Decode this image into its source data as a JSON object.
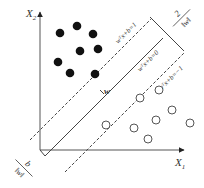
{
  "diagram": {
    "type": "svm-maximum-margin",
    "axes": {
      "x_label": "X",
      "x_sub": "1",
      "y_label": "X",
      "y_sub": "2"
    },
    "lines": {
      "upper_margin": "wᵀx+b=1",
      "hyperplane": "wᵀx+b=0",
      "lower_margin": "wᵀx+b=−1"
    },
    "labels": {
      "normal_vector": "w",
      "margin_width": "2/‖w‖",
      "margin_num": "2",
      "margin_den": "‖w‖",
      "offset": "b",
      "offset_den": "‖w‖"
    },
    "colors": {
      "stroke": "#444444",
      "filled_point": "#111111",
      "hollow_point": "#555555"
    },
    "points": {
      "filled": [
        [
          60,
          33
        ],
        [
          77,
          26
        ],
        [
          93,
          34
        ],
        [
          80,
          51
        ],
        [
          98,
          49
        ],
        [
          58,
          62
        ],
        [
          70,
          73
        ],
        [
          95,
          74
        ]
      ],
      "hollow": [
        [
          106,
          125
        ],
        [
          140,
          98
        ],
        [
          159,
          90
        ],
        [
          172,
          110
        ],
        [
          156,
          120
        ],
        [
          190,
          123
        ],
        [
          134,
          128
        ],
        [
          148,
          139
        ]
      ]
    }
  }
}
